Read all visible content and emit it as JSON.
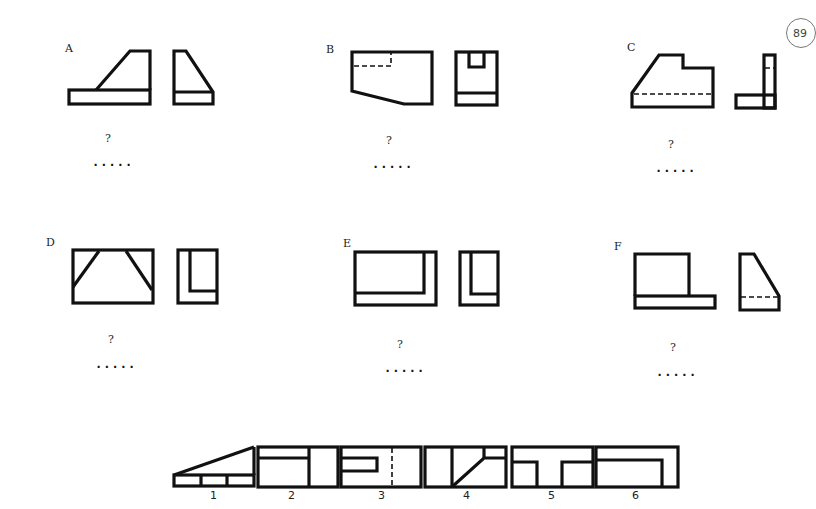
{
  "page": {
    "page_number": "89"
  },
  "problems": [
    {
      "id": "A",
      "label": "A",
      "question": "?",
      "answer_blank": "....."
    },
    {
      "id": "B",
      "label": "B",
      "question": "?",
      "answer_blank": "....."
    },
    {
      "id": "C",
      "label": "C",
      "question": "?",
      "answer_blank": "....."
    },
    {
      "id": "D",
      "label": "D",
      "question": "?",
      "answer_blank": "....."
    },
    {
      "id": "E",
      "label": "E",
      "question": "?",
      "answer_blank": "....."
    },
    {
      "id": "F",
      "label": "F",
      "question": "?",
      "answer_blank": "....."
    }
  ],
  "options": [
    {
      "number": "1"
    },
    {
      "number": "2"
    },
    {
      "number": "3"
    },
    {
      "number": "4"
    },
    {
      "number": "5"
    },
    {
      "number": "6"
    }
  ],
  "colors": {
    "line": "#111111",
    "background": "#ffffff"
  }
}
